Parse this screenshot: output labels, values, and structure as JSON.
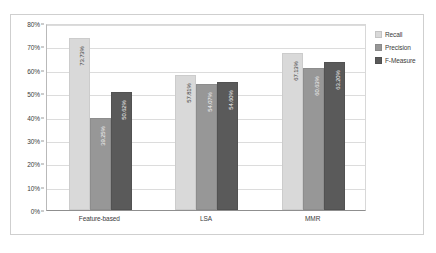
{
  "chart_data": {
    "type": "bar",
    "title": "",
    "xlabel": "",
    "ylabel": "",
    "categories": [
      "Feature-based",
      "LSA",
      "MMR"
    ],
    "series": [
      {
        "name": "Recall",
        "color": "#d9d9d9",
        "values": [
          73.73,
          57.81,
          67.13
        ],
        "labels": [
          "73.73%",
          "57.81%",
          "67.13%"
        ]
      },
      {
        "name": "Precision",
        "color": "#979797",
        "values": [
          39.25,
          54.07,
          60.63
        ],
        "labels": [
          "39.25%",
          "54.07%",
          "60.63%"
        ]
      },
      {
        "name": "F-Measure",
        "color": "#5a5a5a",
        "values": [
          50.62,
          54.6,
          63.2
        ],
        "labels": [
          "50.62%",
          "54.60%",
          "63.20%"
        ]
      }
    ],
    "ylim": [
      0,
      80
    ],
    "y_ticks": [
      0,
      10,
      20,
      30,
      40,
      50,
      60,
      70,
      80
    ],
    "y_tick_labels": [
      "0%",
      "10%",
      "20%",
      "30%",
      "40%",
      "50%",
      "60%",
      "70%",
      "80%"
    ],
    "grid": true,
    "legend_position": "right"
  }
}
